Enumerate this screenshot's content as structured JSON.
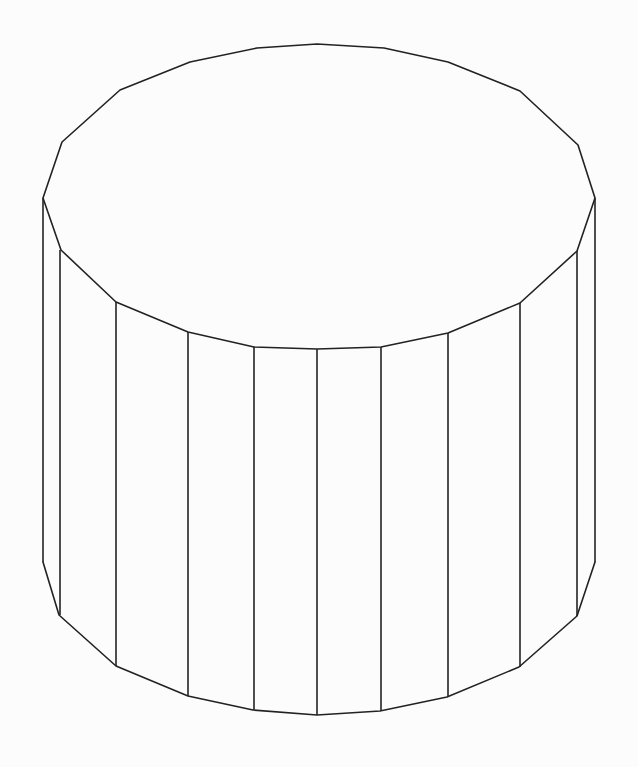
{
  "figure": {
    "stroke_color": "#222222",
    "background_color": "#fcfcfc",
    "top_face": [
      [
        43,
        198
      ],
      [
        62,
        142
      ],
      [
        120,
        90
      ],
      [
        190,
        62
      ],
      [
        257,
        48
      ],
      [
        317,
        44
      ],
      [
        384,
        48
      ],
      [
        448,
        62
      ],
      [
        520,
        91
      ],
      [
        578,
        145
      ],
      [
        595,
        198
      ],
      [
        577,
        251
      ],
      [
        520,
        303
      ],
      [
        448,
        333
      ],
      [
        381,
        347
      ],
      [
        317,
        349
      ],
      [
        254,
        347
      ],
      [
        188,
        332
      ],
      [
        116,
        302
      ],
      [
        61,
        250
      ]
    ],
    "bottom_edge": [
      [
        43,
        562
      ],
      [
        59,
        615
      ],
      [
        116,
        666
      ],
      [
        188,
        696
      ],
      [
        253,
        710
      ],
      [
        317,
        715
      ],
      [
        380,
        711
      ],
      [
        447,
        697
      ],
      [
        519,
        667
      ],
      [
        577,
        616
      ],
      [
        595,
        562
      ]
    ],
    "vertical_edges": [
      {
        "x": 43,
        "y1": 198,
        "y2": 562
      },
      {
        "x": 60,
        "y1": 250,
        "y2": 615
      },
      {
        "x": 116,
        "y1": 302,
        "y2": 666
      },
      {
        "x": 188,
        "y1": 332,
        "y2": 696
      },
      {
        "x": 254,
        "y1": 347,
        "y2": 710
      },
      {
        "x": 317,
        "y1": 349,
        "y2": 715
      },
      {
        "x": 381,
        "y1": 347,
        "y2": 711
      },
      {
        "x": 448,
        "y1": 333,
        "y2": 697
      },
      {
        "x": 520,
        "y1": 303,
        "y2": 667
      },
      {
        "x": 577,
        "y1": 251,
        "y2": 616
      },
      {
        "x": 595,
        "y1": 198,
        "y2": 562
      }
    ]
  }
}
